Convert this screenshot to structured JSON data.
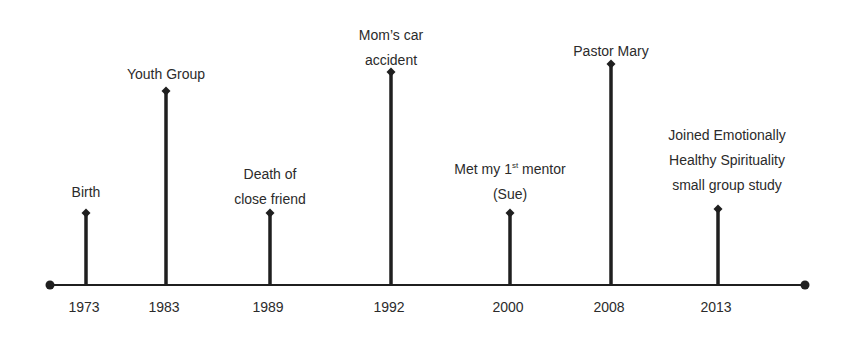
{
  "diagram": {
    "type": "timeline",
    "colors": {
      "line": "#1f1f1f",
      "text": "#2b2b2b",
      "background": "#ffffff"
    },
    "axis": {
      "y": 285,
      "start_x": 50,
      "end_x": 805,
      "start_marker": "dot",
      "end_marker": "dot"
    },
    "events": [
      {
        "year": "1973",
        "x": 86,
        "stem_top": 213,
        "label_lines": [
          "Birth"
        ],
        "label_top": 180
      },
      {
        "year": "1983",
        "x": 166,
        "stem_top": 91,
        "label_lines": [
          "Youth Group"
        ],
        "label_top": 62
      },
      {
        "year": "1989",
        "x": 270,
        "stem_top": 213,
        "label_lines": [
          "Death of",
          "close friend"
        ],
        "label_top": 162
      },
      {
        "year": "1992",
        "x": 391,
        "stem_top": 72,
        "label_lines": [
          "Mom’s car",
          "accident"
        ],
        "label_top": 23
      },
      {
        "year": "2000",
        "x": 510,
        "stem_top": 213,
        "label_lines": [
          "Met my 1",
          "(Sue)"
        ],
        "label_superscript": "st",
        "label_suffix": " mentor",
        "label_top": 157
      },
      {
        "year": "2008",
        "x": 611,
        "stem_top": 64,
        "label_lines": [
          "Pastor Mary"
        ],
        "label_top": 39
      },
      {
        "year": "2013",
        "x": 718,
        "stem_top": 209,
        "label_lines": [
          "Joined Emotionally",
          "Healthy Spirituality",
          "small group study"
        ],
        "label_top": 123,
        "label_center_x": 727
      }
    ]
  }
}
